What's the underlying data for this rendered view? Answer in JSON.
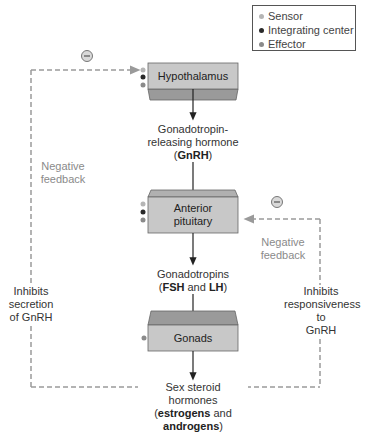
{
  "legend": {
    "items": [
      {
        "label": "Sensor",
        "color": "#b5b5b5"
      },
      {
        "label": "Integrating center",
        "color": "#2a2a2a"
      },
      {
        "label": "Effector",
        "color": "#8a8a8a"
      }
    ]
  },
  "nodes": {
    "hypothalamus": "Hypothalamus",
    "anterior_pituitary_line1": "Anterior",
    "anterior_pituitary_line2": "pituitary",
    "gonads": "Gonads"
  },
  "hormones": {
    "gnrh_line1": "Gonadotropin-",
    "gnrh_line2": "releasing hormone",
    "gnrh_open": "(",
    "gnrh_abbr": "GnRH",
    "gnrh_close": ")",
    "gonadotropins_line1": "Gonadotropins",
    "gonadotropins_open": "(",
    "fsh": "FSH",
    "and": " and ",
    "lh": "LH",
    "gonadotropins_close": ")",
    "steroid_line1": "Sex steroid",
    "steroid_line2": "hormones",
    "steroid_open": "(",
    "estrogens": "estrogens",
    "steroid_and": " and",
    "androgens": "androgens",
    "steroid_close": ")"
  },
  "feedback": {
    "left_label_line1": "Negative",
    "left_label_line2": "feedback",
    "left_effect_line1": "Inhibits",
    "left_effect_line2": "secretion",
    "left_effect_line3": "of GnRH",
    "right_label_line1": "Negative",
    "right_label_line2": "feedback",
    "right_effect_line1": "Inhibits",
    "right_effect_line2": "responsiveness",
    "right_effect_line3": "to",
    "right_effect_line4": "GnRH",
    "minus_symbol": "−"
  },
  "colors": {
    "box_face": "#c8c8c8",
    "box_bevel": "#9a9a9a",
    "box_border": "#666666",
    "dashed_line": "#9a9a9a",
    "arrow": "#222222",
    "sensor_dot": "#b5b5b5",
    "integrating_dot": "#2a2a2a",
    "effector_dot": "#8a8a8a"
  }
}
